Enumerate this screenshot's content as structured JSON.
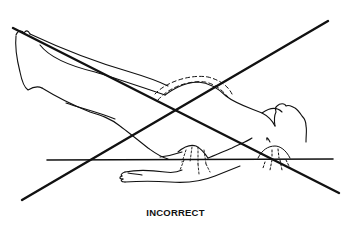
{
  "figure": {
    "caption": "INCORRECT",
    "colors": {
      "ink": "#111111",
      "background": "#ffffff"
    },
    "icons": {
      "cross_mark": "x-mark-icon"
    }
  }
}
